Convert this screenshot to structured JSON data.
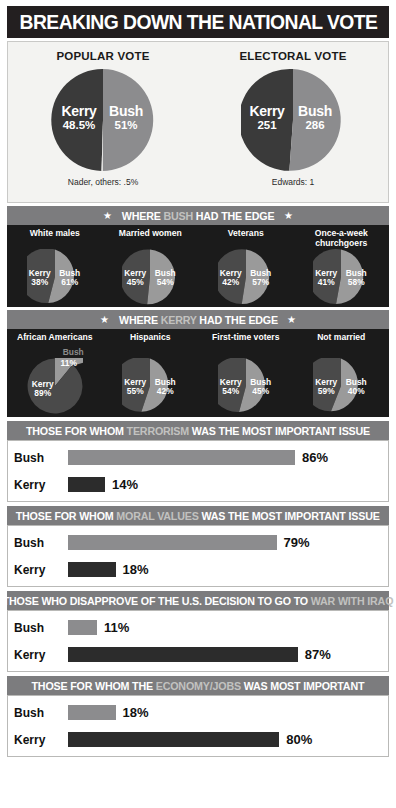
{
  "header": {
    "title": "BREAKING DOWN THE NATIONAL VOTE",
    "star": "★"
  },
  "chart_data": [
    {
      "type": "pie",
      "title": "POPULAR VOTE",
      "labels": [
        "Kerry",
        "Bush",
        "Nader, others"
      ],
      "values": [
        48.5,
        51,
        0.5
      ],
      "value_labels": [
        "48.5%",
        "51%",
        ".5%"
      ],
      "footnote": "Nader, others: .5%"
    },
    {
      "type": "pie",
      "title": "ELECTORAL VOTE",
      "labels": [
        "Kerry",
        "Bush",
        "Edwards"
      ],
      "values": [
        251,
        286,
        1
      ],
      "value_labels": [
        "251",
        "286",
        "1"
      ],
      "footnote": "Edwards: 1"
    },
    {
      "type": "pie",
      "title": "White males",
      "labels": [
        "Kerry",
        "Bush"
      ],
      "values": [
        38,
        61
      ],
      "value_labels": [
        "38%",
        "61%"
      ],
      "group": "bush-edge"
    },
    {
      "type": "pie",
      "title": "Married women",
      "labels": [
        "Kerry",
        "Bush"
      ],
      "values": [
        45,
        54
      ],
      "value_labels": [
        "45%",
        "54%"
      ],
      "group": "bush-edge"
    },
    {
      "type": "pie",
      "title": "Veterans",
      "labels": [
        "Kerry",
        "Bush"
      ],
      "values": [
        42,
        57
      ],
      "value_labels": [
        "42%",
        "57%"
      ],
      "group": "bush-edge"
    },
    {
      "type": "pie",
      "title": "Once-a-week churchgoers",
      "labels": [
        "Kerry",
        "Bush"
      ],
      "values": [
        41,
        58
      ],
      "value_labels": [
        "41%",
        "58%"
      ],
      "group": "bush-edge"
    },
    {
      "type": "pie",
      "title": "African Americans",
      "labels": [
        "Kerry",
        "Bush"
      ],
      "values": [
        89,
        11
      ],
      "value_labels": [
        "89%",
        "11%"
      ],
      "group": "kerry-edge"
    },
    {
      "type": "pie",
      "title": "Hispanics",
      "labels": [
        "Kerry",
        "Bush"
      ],
      "values": [
        55,
        42
      ],
      "value_labels": [
        "55%",
        "42%"
      ],
      "group": "kerry-edge"
    },
    {
      "type": "pie",
      "title": "First-time voters",
      "labels": [
        "Kerry",
        "Bush"
      ],
      "values": [
        54,
        45
      ],
      "value_labels": [
        "54%",
        "45%"
      ],
      "group": "kerry-edge"
    },
    {
      "type": "pie",
      "title": "Not married",
      "labels": [
        "Kerry",
        "Bush"
      ],
      "values": [
        59,
        40
      ],
      "value_labels": [
        "59%",
        "40%"
      ],
      "group": "kerry-edge"
    },
    {
      "type": "bar",
      "title": "THOSE FOR WHOM TERRORISM WAS THE MOST IMPORTANT ISSUE",
      "categories": [
        "Bush",
        "Kerry"
      ],
      "values": [
        86,
        14
      ],
      "value_labels": [
        "86%",
        "14%"
      ],
      "xlim": [
        0,
        100
      ]
    },
    {
      "type": "bar",
      "title": "THOSE FOR WHOM MORAL VALUES WAS THE MOST IMPORTANT ISSUE",
      "categories": [
        "Bush",
        "Kerry"
      ],
      "values": [
        79,
        18
      ],
      "value_labels": [
        "79%",
        "18%"
      ],
      "xlim": [
        0,
        100
      ]
    },
    {
      "type": "bar",
      "title": "THOSE WHO DISAPPROVE OF THE U.S. DECISION TO GO TO WAR WITH IRAQ",
      "categories": [
        "Bush",
        "Kerry"
      ],
      "values": [
        11,
        87
      ],
      "value_labels": [
        "11%",
        "87%"
      ],
      "xlim": [
        0,
        100
      ]
    },
    {
      "type": "bar",
      "title": "THOSE FOR WHOM THE ECONOMY/JOBS WAS MOST IMPORTANT",
      "categories": [
        "Bush",
        "Kerry"
      ],
      "values": [
        18,
        80
      ],
      "value_labels": [
        "18%",
        "80%"
      ],
      "xlim": [
        0,
        100
      ]
    }
  ],
  "vote_section": {
    "popular": {
      "title": "POPULAR VOTE",
      "kerry_name": "Kerry",
      "kerry_value": "48.5%",
      "bush_name": "Bush",
      "bush_value": "51%",
      "footnote": "Nader, others: .5%"
    },
    "electoral": {
      "title": "ELECTORAL VOTE",
      "kerry_name": "Kerry",
      "kerry_value": "251",
      "bush_name": "Bush",
      "bush_value": "286",
      "footnote": "Edwards: 1"
    }
  },
  "bush_edge": {
    "band_pre": "WHERE ",
    "band_hl": "BUSH",
    "band_post": " HAD THE EDGE",
    "items": [
      {
        "label": "White males",
        "kerry_name": "Kerry",
        "kerry_value": "38%",
        "bush_name": "Bush",
        "bush_value": "61%"
      },
      {
        "label": "Married women",
        "kerry_name": "Kerry",
        "kerry_value": "45%",
        "bush_name": "Bush",
        "bush_value": "54%"
      },
      {
        "label": "Veterans",
        "kerry_name": "Kerry",
        "kerry_value": "42%",
        "bush_name": "Bush",
        "bush_value": "57%"
      },
      {
        "label": "Once-a-week churchgoers",
        "kerry_name": "Kerry",
        "kerry_value": "41%",
        "bush_name": "Bush",
        "bush_value": "58%"
      }
    ]
  },
  "kerry_edge": {
    "band_pre": "WHERE ",
    "band_hl": "KERRY",
    "band_post": " HAD THE EDGE",
    "items": [
      {
        "label": "African Americans",
        "kerry_name": "Kerry",
        "kerry_value": "89%",
        "bush_name": "Bush",
        "bush_value": "11%"
      },
      {
        "label": "Hispanics",
        "kerry_name": "Kerry",
        "kerry_value": "55%",
        "bush_name": "Bush",
        "bush_value": "42%"
      },
      {
        "label": "First-time voters",
        "kerry_name": "Kerry",
        "kerry_value": "54%",
        "bush_name": "Bush",
        "bush_value": "45%"
      },
      {
        "label": "Not married",
        "kerry_name": "Kerry",
        "kerry_value": "59%",
        "bush_name": "Bush",
        "bush_value": "40%"
      }
    ]
  },
  "issues": [
    {
      "band_pre": "THOSE FOR WHOM ",
      "band_hl": "TERRORISM",
      "band_post": " WAS THE MOST IMPORTANT ISSUE",
      "bush_label": "Bush",
      "bush_value": "86%",
      "bush_pct": 86,
      "kerry_label": "Kerry",
      "kerry_value": "14%",
      "kerry_pct": 14
    },
    {
      "band_pre": "THOSE FOR WHOM ",
      "band_hl": "MORAL VALUES",
      "band_post": " WAS THE MOST IMPORTANT ISSUE",
      "bush_label": "Bush",
      "bush_value": "79%",
      "bush_pct": 79,
      "kerry_label": "Kerry",
      "kerry_value": "18%",
      "kerry_pct": 18
    },
    {
      "band_pre": "THOSE WHO DISAPPROVE OF THE U.S. DECISION TO GO TO ",
      "band_hl": "WAR WITH IRAQ",
      "band_post": "",
      "bush_label": "Bush",
      "bush_value": "11%",
      "bush_pct": 11,
      "kerry_label": "Kerry",
      "kerry_value": "87%",
      "kerry_pct": 87
    },
    {
      "band_pre": "THOSE FOR WHOM THE ",
      "band_hl": "ECONOMY/JOBS",
      "band_post": " WAS MOST IMPORTANT",
      "bush_label": "Bush",
      "bush_value": "18%",
      "bush_pct": 18,
      "kerry_label": "Kerry",
      "kerry_value": "80%",
      "kerry_pct": 80
    }
  ],
  "colors": {
    "kerry_dark": "#3a3a3a",
    "bush_gray": "#8c8c8e",
    "band_gray": "#7c7c7e",
    "header_black": "#231f20",
    "panel_bg": "#f3f3f1",
    "demo_bg": "#1b1b1b"
  },
  "star": "★"
}
